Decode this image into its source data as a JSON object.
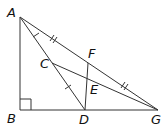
{
  "diagram": {
    "type": "geometry",
    "points": {
      "A": {
        "label": "A",
        "x": 20,
        "y": 17
      },
      "B": {
        "label": "B",
        "x": 20,
        "y": 110
      },
      "C": {
        "label": "C",
        "x": 52,
        "y": 63
      },
      "D": {
        "label": "D",
        "x": 85,
        "y": 110
      },
      "E": {
        "label": "E",
        "x": 87,
        "y": 79
      },
      "F": {
        "label": "F",
        "x": 88,
        "y": 63
      },
      "G": {
        "label": "G",
        "x": 158,
        "y": 110
      }
    },
    "segments": [
      "AB",
      "BG",
      "AG",
      "AD",
      "CG",
      "DF"
    ],
    "right_angle_at": "B",
    "tick_marks": {
      "single": [
        "AC",
        "CD"
      ],
      "double": [
        "AF",
        "FG"
      ]
    }
  }
}
